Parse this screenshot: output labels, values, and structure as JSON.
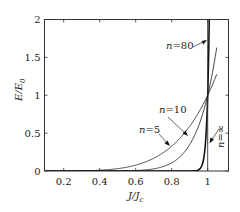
{
  "chart_data": {
    "type": "line",
    "title": "",
    "xlabel": "J/J_c",
    "xlabel_main": "J/J",
    "xlabel_sub": "c",
    "ylabel": "E/E_0",
    "ylabel_main": "E/E",
    "ylabel_sub": "0",
    "xlim": [
      0.1,
      1.11
    ],
    "ylim": [
      0,
      2
    ],
    "x_ticks": [
      0.2,
      0.4,
      0.6,
      0.8,
      1
    ],
    "x_tick_labels": [
      "0.2",
      "0.4",
      "0.6",
      "0.8",
      "1"
    ],
    "y_ticks": [
      0,
      0.5,
      1,
      1.5,
      2
    ],
    "y_tick_labels": [
      "0",
      "0.5",
      "1",
      "1.5",
      "2"
    ],
    "grid": false,
    "legend": "inline annotations with leader arrows",
    "formula": "E/E0 = (J/Jc)^n",
    "series": [
      {
        "name": "n=5",
        "n": 5,
        "x_end": 1.05,
        "points": [
          [
            0.4,
            0.01
          ],
          [
            0.5,
            0.03
          ],
          [
            0.6,
            0.08
          ],
          [
            0.7,
            0.17
          ],
          [
            0.8,
            0.33
          ],
          [
            0.9,
            0.59
          ],
          [
            1.0,
            1.0
          ],
          [
            1.05,
            1.28
          ]
        ]
      },
      {
        "name": "n=10",
        "n": 10,
        "x_end": 1.05,
        "points": [
          [
            0.6,
            0.006
          ],
          [
            0.7,
            0.03
          ],
          [
            0.8,
            0.11
          ],
          [
            0.9,
            0.35
          ],
          [
            1.0,
            1.0
          ],
          [
            1.05,
            1.63
          ]
        ]
      },
      {
        "name": "n=80",
        "n": 80,
        "x_end": 1.0087,
        "points": [
          [
            0.94,
            0.007
          ],
          [
            0.96,
            0.04
          ],
          [
            0.98,
            0.2
          ],
          [
            1.0,
            1.0
          ],
          [
            1.0087,
            2.0
          ]
        ]
      },
      {
        "name": "n=∞",
        "n": "inf",
        "points": [
          [
            1.0,
            0
          ],
          [
            1.0,
            2.0
          ]
        ]
      }
    ]
  },
  "annotations": {
    "n80": {
      "var": "n",
      "text": "=80"
    },
    "n10": {
      "var": "n",
      "text": "=10"
    },
    "n5": {
      "var": "n",
      "text": "=5"
    },
    "ninf": {
      "var": "n",
      "text": "=∞"
    }
  }
}
